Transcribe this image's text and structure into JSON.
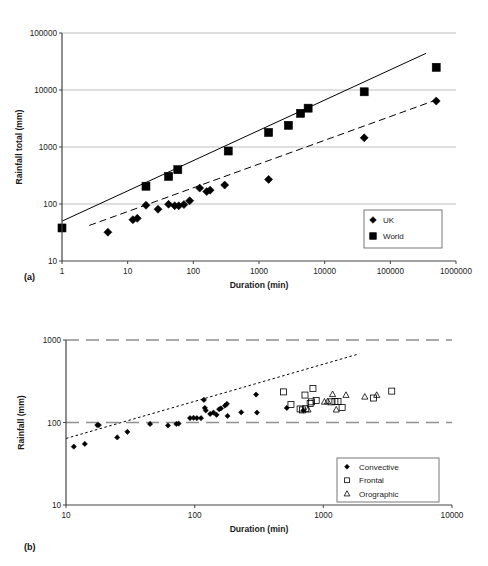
{
  "figure": {
    "panel_a_tag": "(a)",
    "panel_b_tag": "(b)"
  },
  "chart_data": [
    {
      "id": "a",
      "type": "scatter",
      "title": "",
      "xlabel": "Duration (min)",
      "ylabel": "Rainfall total (mm)",
      "xscale": "log",
      "yscale": "log",
      "xlim": [
        1,
        1000000
      ],
      "ylim": [
        10,
        100000
      ],
      "xticks": [
        1,
        10,
        100,
        1000,
        10000,
        100000,
        1000000
      ],
      "xtick_labels": [
        "1",
        "10",
        "100",
        "1000",
        "10000",
        "100000",
        "1000000"
      ],
      "yticks": [
        10,
        100,
        1000,
        10000,
        100000
      ],
      "ytick_labels": [
        "10",
        "100",
        "1000",
        "10000",
        "100000"
      ],
      "grid": "horizontal",
      "legend_position": "lower-right",
      "series": [
        {
          "name": "UK",
          "marker": "filled-diamond",
          "color": "#000000",
          "points": [
            [
              5,
              32
            ],
            [
              12,
              53
            ],
            [
              14,
              56
            ],
            [
              19,
              95
            ],
            [
              29,
              81
            ],
            [
              42,
              99
            ],
            [
              52,
              93
            ],
            [
              60,
              93
            ],
            [
              72,
              98
            ],
            [
              88,
              114
            ],
            [
              125,
              190
            ],
            [
              160,
              165
            ],
            [
              180,
              175
            ],
            [
              300,
              215
            ],
            [
              1400,
              270
            ],
            [
              40000,
              1450
            ],
            [
              500000,
              6400
            ]
          ]
        },
        {
          "name": "World",
          "marker": "filled-square",
          "color": "#000000",
          "points": [
            [
              1,
              38
            ],
            [
              19,
              205
            ],
            [
              42,
              305
            ],
            [
              58,
              400
            ],
            [
              340,
              850
            ],
            [
              1400,
              1800
            ],
            [
              2800,
              2400
            ],
            [
              4300,
              3900
            ],
            [
              5600,
              4800
            ],
            [
              40000,
              9300
            ],
            [
              500000,
              25000
            ]
          ]
        }
      ],
      "trendlines": [
        {
          "name": "world-envelope",
          "style": "solid",
          "points": [
            [
              1,
              50
            ],
            [
              350000,
              44000
            ]
          ]
        },
        {
          "name": "uk-envelope",
          "style": "dashed",
          "points": [
            [
              2.6,
              42
            ],
            [
              500000,
              6700
            ]
          ]
        }
      ]
    },
    {
      "id": "b",
      "type": "scatter",
      "title": "",
      "xlabel": "Duration (min)",
      "ylabel": "Rainfall (mm)",
      "xscale": "log",
      "yscale": "log",
      "xlim": [
        10,
        10000
      ],
      "ylim": [
        10,
        1000
      ],
      "xticks": [
        10,
        100,
        1000,
        10000
      ],
      "xtick_labels": [
        "10",
        "100",
        "1000",
        "10000"
      ],
      "yticks": [
        10,
        100,
        1000
      ],
      "ytick_labels": [
        "10",
        "100",
        "1000"
      ],
      "grid": "horizontal-dashed",
      "legend_position": "lower-right",
      "series": [
        {
          "name": "Convective",
          "marker": "filled-diamond",
          "color": "#000000",
          "points": [
            [
              11.5,
              51
            ],
            [
              14,
              55
            ],
            [
              17.5,
              93
            ],
            [
              18,
              93
            ],
            [
              25,
              66
            ],
            [
              30,
              77
            ],
            [
              45,
              96
            ],
            [
              62,
              92
            ],
            [
              72,
              96
            ],
            [
              75,
              97
            ],
            [
              92,
              113
            ],
            [
              98,
              114
            ],
            [
              104,
              113
            ],
            [
              112,
              113
            ],
            [
              118,
              188
            ],
            [
              120,
              150
            ],
            [
              122,
              140
            ],
            [
              132,
              127
            ],
            [
              140,
              132
            ],
            [
              148,
              124
            ],
            [
              155,
              145
            ],
            [
              160,
              148
            ],
            [
              172,
              160
            ],
            [
              178,
              168
            ],
            [
              180,
              120
            ],
            [
              230,
              133
            ],
            [
              300,
              218
            ],
            [
              305,
              132
            ],
            [
              520,
              150
            ],
            [
              700,
              140
            ]
          ]
        },
        {
          "name": "Frontal",
          "marker": "open-square",
          "color": "#000000",
          "points": [
            [
              490,
              235
            ],
            [
              560,
              165
            ],
            [
              660,
              146
            ],
            [
              690,
              142
            ],
            [
              720,
              215
            ],
            [
              730,
              147
            ],
            [
              790,
              170
            ],
            [
              810,
              178
            ],
            [
              830,
              258
            ],
            [
              880,
              185
            ],
            [
              1150,
              178
            ],
            [
              1230,
              180
            ],
            [
              1300,
              180
            ],
            [
              1400,
              152
            ],
            [
              2450,
              198
            ],
            [
              3400,
              240
            ]
          ]
        },
        {
          "name": "Orographic",
          "marker": "open-triangle",
          "color": "#000000",
          "points": [
            [
              760,
              143
            ],
            [
              1020,
              178
            ],
            [
              1080,
              180
            ],
            [
              1180,
              220
            ],
            [
              1260,
              143
            ],
            [
              1500,
              215
            ],
            [
              2100,
              205
            ],
            [
              2600,
              215
            ]
          ]
        }
      ],
      "trendlines": [
        {
          "name": "upper-envelope",
          "style": "dotted",
          "points": [
            [
              10,
              64
            ],
            [
              1900,
              680
            ]
          ]
        }
      ]
    }
  ],
  "legends": {
    "a": [
      {
        "label": "UK",
        "marker": "filled-diamond"
      },
      {
        "label": "World",
        "marker": "filled-square"
      }
    ],
    "b": [
      {
        "label": "Convective",
        "marker": "filled-diamond"
      },
      {
        "label": "Frontal",
        "marker": "open-square"
      },
      {
        "label": "Orographic",
        "marker": "open-triangle"
      }
    ]
  },
  "colors": {
    "axis": "#444444",
    "grid": "#b8b8b8",
    "marker": "#000000",
    "background": "#ffffff"
  }
}
